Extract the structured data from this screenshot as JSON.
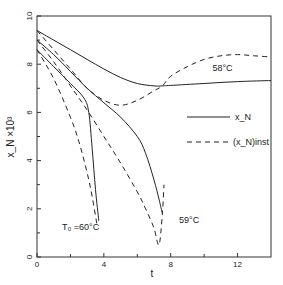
{
  "chart_data": {
    "type": "line",
    "title": "",
    "xlabel": "t",
    "ylabel": "x_N ×10³",
    "xlim": [
      0,
      14
    ],
    "ylim": [
      0,
      10
    ],
    "x_ticks": [
      0,
      4,
      8,
      12
    ],
    "x_tick_labels": [
      "0",
      "4",
      "8",
      "12"
    ],
    "x_minor_ticks": [
      2,
      6,
      10
    ],
    "y_ticks": [
      0,
      2,
      4,
      6,
      8,
      10
    ],
    "y_tick_labels": [
      "0",
      "2",
      "4",
      "6",
      "8",
      "10"
    ],
    "grid": false,
    "legend": {
      "position": "right-middle",
      "entries": [
        {
          "label": "x_N",
          "style": "solid"
        },
        {
          "label": "(x_N)inst",
          "style": "dashed"
        }
      ]
    },
    "annotations": [
      {
        "text": "58°C",
        "x": 10.5,
        "y": 7.7
      },
      {
        "text": "59°C",
        "x": 8.5,
        "y": 1.4
      },
      {
        "text": "T₀ =60°C",
        "x": 1.5,
        "y": 1.1
      }
    ],
    "series": [
      {
        "name": "x_N (58°C)",
        "style": "solid",
        "x": [
          0,
          1,
          2,
          3,
          4,
          5,
          6,
          7,
          7.5,
          8,
          10,
          12,
          14
        ],
        "y": [
          9.4,
          9.0,
          8.6,
          8.2,
          7.8,
          7.45,
          7.2,
          7.1,
          7.1,
          7.12,
          7.2,
          7.28,
          7.32
        ]
      },
      {
        "name": "(x_N)inst (58°C)",
        "style": "dashed",
        "x": [
          0,
          1,
          2,
          3,
          4,
          5,
          6,
          7,
          7.5,
          8,
          9,
          10,
          11,
          12,
          13,
          14
        ],
        "y": [
          9.4,
          8.6,
          7.8,
          7.0,
          6.5,
          6.3,
          6.5,
          6.9,
          7.1,
          7.5,
          7.9,
          8.2,
          8.35,
          8.4,
          8.35,
          8.3
        ]
      },
      {
        "name": "x_N (59°C)",
        "style": "solid",
        "x": [
          0,
          1,
          2,
          3,
          4,
          5,
          6,
          6.5,
          7,
          7.3,
          7.5
        ],
        "y": [
          9.0,
          8.4,
          7.7,
          7.0,
          6.4,
          5.8,
          5.0,
          4.3,
          3.2,
          2.4,
          1.8
        ]
      },
      {
        "name": "(x_N)inst (59°C)",
        "style": "dashed",
        "x": [
          0,
          1,
          2,
          3,
          4,
          5,
          6,
          6.5,
          7,
          7.3,
          7.5,
          7.6
        ],
        "y": [
          9.0,
          8.1,
          7.1,
          6.1,
          5.0,
          3.9,
          2.7,
          2.0,
          1.2,
          0.5,
          1.8,
          3.0
        ]
      },
      {
        "name": "x_N (60°C)",
        "style": "solid",
        "x": [
          0,
          1,
          2,
          2.8,
          3.1,
          3.3,
          3.5,
          3.7
        ],
        "y": [
          8.6,
          7.9,
          7.2,
          6.6,
          6.0,
          4.5,
          2.8,
          1.5
        ]
      },
      {
        "name": "(x_N)inst (60°C)",
        "style": "dashed",
        "x": [
          0,
          1,
          2,
          2.5,
          3,
          3.3,
          3.6
        ],
        "y": [
          8.6,
          7.4,
          5.8,
          4.8,
          3.5,
          2.5,
          1.3
        ]
      }
    ]
  }
}
